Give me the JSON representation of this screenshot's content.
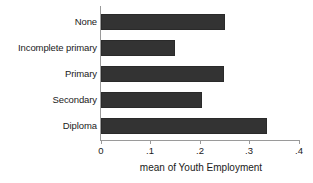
{
  "chart_data": {
    "type": "bar",
    "orientation": "horizontal",
    "title": "",
    "subtitle": "",
    "xlabel": "mean of Youth Employment",
    "ylabel": "",
    "categories": [
      "None",
      "Incomplete primary",
      "Primary",
      "Secondary",
      "Diploma"
    ],
    "values": [
      0.247,
      0.148,
      0.245,
      0.202,
      0.332
    ],
    "series": [
      {
        "name": "mean of Youth Employment",
        "values": [
          0.247,
          0.148,
          0.245,
          0.202,
          0.332
        ]
      }
    ],
    "xlim": [
      0,
      0.4
    ],
    "xticks": [
      0,
      0.1,
      0.2,
      0.3,
      0.4
    ],
    "xtick_labels": [
      "0",
      ".1",
      ".2",
      ".3",
      ".4"
    ],
    "grid": false,
    "legend": false,
    "legend_position": "none",
    "bar_color": "#333333",
    "axis_color": "#9a9a9a",
    "background": "#ffffff"
  },
  "axis": {
    "x_title": "mean of Youth Employment",
    "ticks": [
      {
        "label": "0",
        "value": 0
      },
      {
        "label": ".1",
        "value": 0.1
      },
      {
        "label": ".2",
        "value": 0.2
      },
      {
        "label": ".3",
        "value": 0.3
      },
      {
        "label": ".4",
        "value": 0.4
      }
    ]
  },
  "categories": [
    {
      "label": "None",
      "value": 0.247
    },
    {
      "label": "Incomplete primary",
      "value": 0.148
    },
    {
      "label": "Primary",
      "value": 0.245
    },
    {
      "label": "Secondary",
      "value": 0.202
    },
    {
      "label": "Diploma",
      "value": 0.332
    }
  ]
}
